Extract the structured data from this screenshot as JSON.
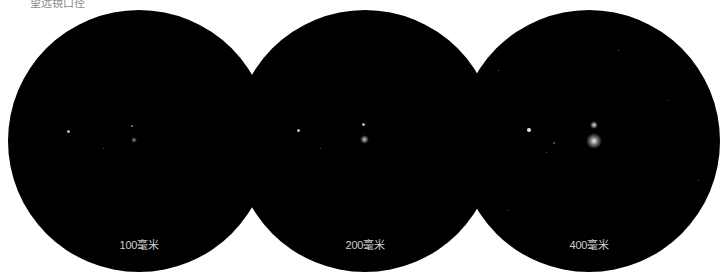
{
  "caption": "望远镜口径",
  "views": [
    {
      "label": "100毫米",
      "aperture_mm": 100
    },
    {
      "label": "200毫米",
      "aperture_mm": 200
    },
    {
      "label": "400毫米",
      "aperture_mm": 400
    }
  ]
}
